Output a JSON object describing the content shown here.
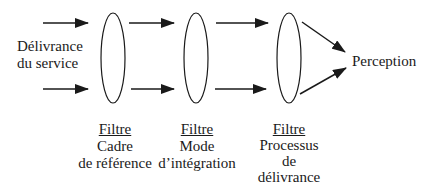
{
  "diagram": {
    "input_label": [
      "Délivrance",
      "du service"
    ],
    "output_label": "Perception",
    "filters": [
      {
        "heading": "Filtre",
        "lines": [
          "Cadre",
          "de référence"
        ]
      },
      {
        "heading": "Filtre",
        "lines": [
          "Mode",
          "d’intégration"
        ]
      },
      {
        "heading": "Filtre",
        "lines": [
          "Processus",
          "de",
          "délivrance"
        ]
      }
    ],
    "colors": {
      "stroke": "#1a1a1a",
      "background": "#ffffff"
    }
  }
}
